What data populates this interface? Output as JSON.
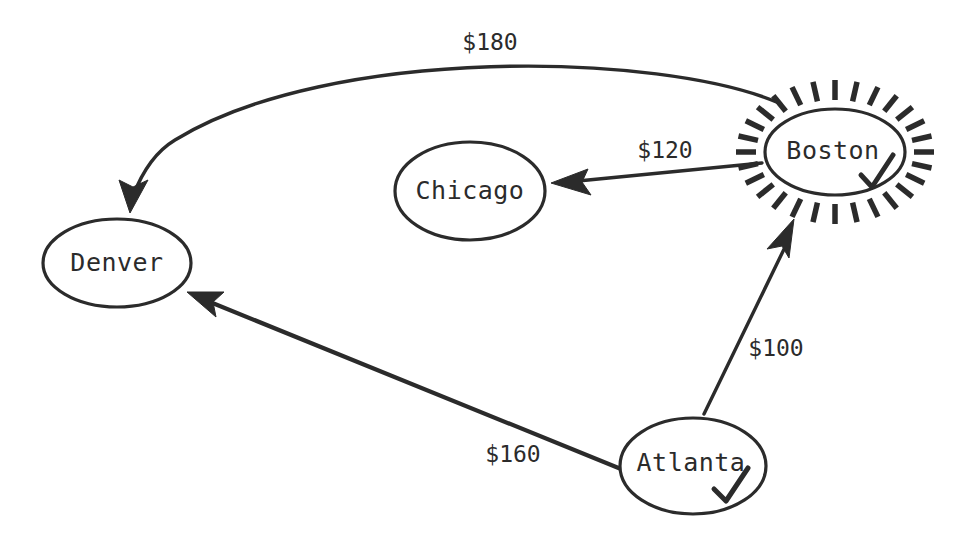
{
  "diagram": {
    "type": "directed-graph",
    "background_color": "#ffffff",
    "ink_color": "#2b2b2b",
    "nodes": [
      {
        "id": "denver",
        "label": "Denver",
        "cx": 117,
        "cy": 263,
        "rx": 74,
        "ry": 44,
        "visited": false,
        "highlighted": false
      },
      {
        "id": "chicago",
        "label": "Chicago",
        "cx": 470,
        "cy": 191,
        "rx": 75,
        "ry": 49,
        "visited": false,
        "highlighted": false
      },
      {
        "id": "boston",
        "label": "Boston",
        "cx": 835,
        "cy": 152,
        "rx": 70,
        "ry": 43,
        "visited": true,
        "highlighted": true
      },
      {
        "id": "atlanta",
        "label": "Atlanta",
        "cx": 693,
        "cy": 466,
        "rx": 73,
        "ry": 48,
        "visited": true,
        "highlighted": false
      }
    ],
    "edges": [
      {
        "id": "boston-denver",
        "from": "boston",
        "to": "denver",
        "label": "$180",
        "label_x": 490,
        "label_y": 43,
        "curved": true
      },
      {
        "id": "boston-chicago",
        "from": "boston",
        "to": "chicago",
        "label": "$120",
        "label_x": 665,
        "label_y": 151,
        "curved": false
      },
      {
        "id": "atlanta-boston",
        "from": "atlanta",
        "to": "boston",
        "label": "$100",
        "label_x": 776,
        "label_y": 349,
        "curved": false
      },
      {
        "id": "atlanta-denver",
        "from": "atlanta",
        "to": "denver",
        "label": "$160",
        "label_x": 513,
        "label_y": 455,
        "curved": false
      }
    ],
    "sunburst": {
      "node": "boston",
      "ray_count": 28,
      "inner_pad": 9,
      "ray_length": 20
    }
  }
}
